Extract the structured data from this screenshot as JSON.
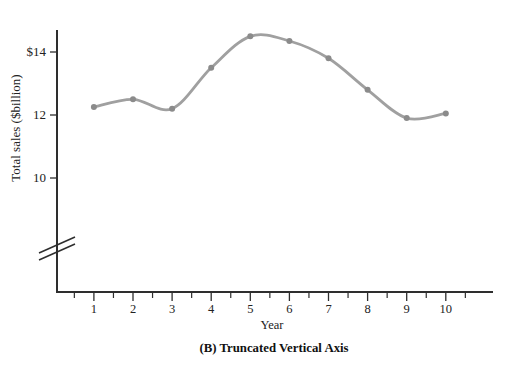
{
  "figure": {
    "caption": "(B) Truncated Vertical Axis"
  },
  "chart_data": {
    "type": "line",
    "title": "",
    "xlabel": "Year",
    "ylabel": "Total sales ($billion)",
    "x": [
      1,
      2,
      3,
      4,
      5,
      6,
      7,
      8,
      9,
      10
    ],
    "values": [
      12.25,
      12.5,
      12.2,
      13.5,
      14.5,
      14.35,
      13.8,
      12.8,
      11.9,
      12.05
    ],
    "x_tick_labels": [
      "1",
      "2",
      "3",
      "4",
      "5",
      "6",
      "7",
      "8",
      "9",
      "10"
    ],
    "y_ticks": [
      {
        "value": 14,
        "label": "$14"
      },
      {
        "value": 12,
        "label": "12"
      },
      {
        "value": 10,
        "label": "10"
      }
    ],
    "xlim": [
      0,
      11.2
    ],
    "ylim_shown": [
      9.3,
      15.0
    ],
    "axis_break": true,
    "grid": false,
    "legend": false,
    "series_color": "#a0a0a0",
    "marker_color": "#8b8b8b",
    "axis_color": "#2e2e2e"
  }
}
